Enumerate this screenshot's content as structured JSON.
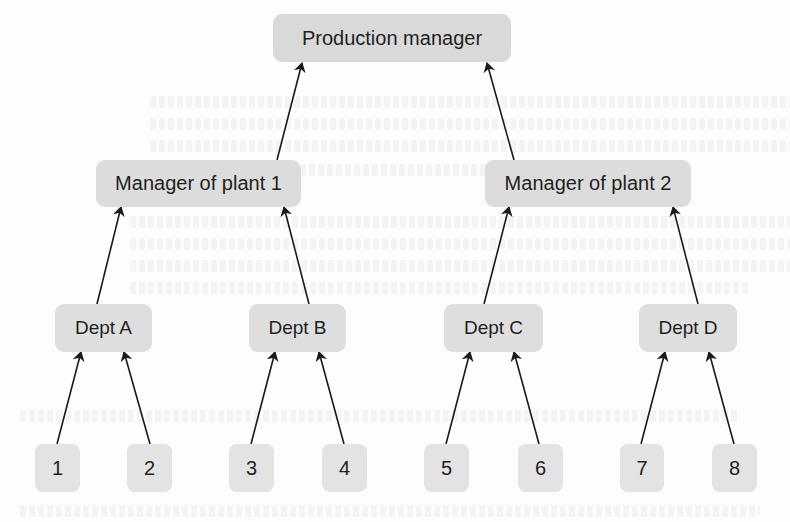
{
  "diagram": {
    "type": "hierarchy",
    "direction": "bottom-up",
    "colors": {
      "node_fill_top": "#d9d9d9",
      "node_fill_mid": "#dcdcdc",
      "node_fill_dept": "#dedede",
      "node_fill_leaf": "#e3e3e3",
      "text": "#1f1f1f",
      "edge": "#1a1a1a"
    },
    "nodes": {
      "production_manager": {
        "label": "Production manager",
        "x": 273,
        "y": 14,
        "w": 238,
        "h": 48
      },
      "manager_plant_1": {
        "label": "Manager of plant 1",
        "x": 96,
        "y": 160,
        "w": 205,
        "h": 47
      },
      "manager_plant_2": {
        "label": "Manager of plant 2",
        "x": 485,
        "y": 160,
        "w": 206,
        "h": 47
      },
      "dept_a": {
        "label": "Dept A",
        "x": 55,
        "y": 304,
        "w": 97,
        "h": 48
      },
      "dept_b": {
        "label": "Dept B",
        "x": 249,
        "y": 304,
        "w": 97,
        "h": 48
      },
      "dept_c": {
        "label": "Dept C",
        "x": 444,
        "y": 304,
        "w": 99,
        "h": 48
      },
      "dept_d": {
        "label": "Dept D",
        "x": 639,
        "y": 304,
        "w": 98,
        "h": 48
      },
      "unit_1": {
        "label": "1",
        "x": 35,
        "y": 444,
        "w": 45,
        "h": 48
      },
      "unit_2": {
        "label": "2",
        "x": 127,
        "y": 444,
        "w": 45,
        "h": 48
      },
      "unit_3": {
        "label": "3",
        "x": 229,
        "y": 444,
        "w": 45,
        "h": 48
      },
      "unit_4": {
        "label": "4",
        "x": 322,
        "y": 444,
        "w": 45,
        "h": 48
      },
      "unit_5": {
        "label": "5",
        "x": 424,
        "y": 444,
        "w": 45,
        "h": 48
      },
      "unit_6": {
        "label": "6",
        "x": 518,
        "y": 444,
        "w": 45,
        "h": 48
      },
      "unit_7": {
        "label": "7",
        "x": 620,
        "y": 444,
        "w": 44,
        "h": 48
      },
      "unit_8": {
        "label": "8",
        "x": 712,
        "y": 444,
        "w": 45,
        "h": 48
      }
    },
    "edges": [
      {
        "from": "manager_plant_1",
        "to": "production_manager",
        "x1": 277,
        "y1": 160,
        "x2": 302,
        "y2": 63
      },
      {
        "from": "manager_plant_2",
        "to": "production_manager",
        "x1": 514,
        "y1": 160,
        "x2": 487,
        "y2": 63
      },
      {
        "from": "dept_a",
        "to": "manager_plant_1",
        "x1": 97,
        "y1": 304,
        "x2": 121,
        "y2": 207
      },
      {
        "from": "dept_b",
        "to": "manager_plant_1",
        "x1": 309,
        "y1": 304,
        "x2": 284,
        "y2": 207
      },
      {
        "from": "dept_c",
        "to": "manager_plant_2",
        "x1": 484,
        "y1": 304,
        "x2": 509,
        "y2": 207
      },
      {
        "from": "dept_d",
        "to": "manager_plant_2",
        "x1": 698,
        "y1": 304,
        "x2": 673,
        "y2": 207
      },
      {
        "from": "unit_1",
        "to": "dept_a",
        "x1": 57,
        "y1": 444,
        "x2": 81,
        "y2": 352
      },
      {
        "from": "unit_2",
        "to": "dept_a",
        "x1": 150,
        "y1": 444,
        "x2": 124,
        "y2": 352
      },
      {
        "from": "unit_3",
        "to": "dept_b",
        "x1": 251,
        "y1": 444,
        "x2": 275,
        "y2": 352
      },
      {
        "from": "unit_4",
        "to": "dept_b",
        "x1": 344,
        "y1": 444,
        "x2": 319,
        "y2": 352
      },
      {
        "from": "unit_5",
        "to": "dept_c",
        "x1": 446,
        "y1": 444,
        "x2": 470,
        "y2": 352
      },
      {
        "from": "unit_6",
        "to": "dept_c",
        "x1": 539,
        "y1": 444,
        "x2": 514,
        "y2": 352
      },
      {
        "from": "unit_7",
        "to": "dept_d",
        "x1": 641,
        "y1": 444,
        "x2": 665,
        "y2": 352
      },
      {
        "from": "unit_8",
        "to": "dept_d",
        "x1": 734,
        "y1": 444,
        "x2": 709,
        "y2": 352
      }
    ]
  }
}
